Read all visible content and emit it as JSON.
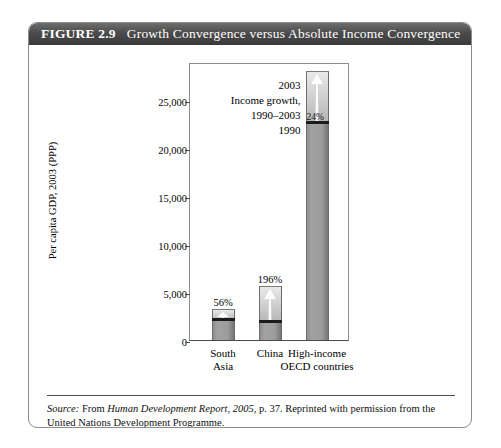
{
  "figure": {
    "number": "FIGURE 2.9",
    "title": "Growth Convergence versus Absolute Income Convergence"
  },
  "annotation": {
    "top": "2003",
    "middle_line1": "Income growth,",
    "middle_line2": "1990–2003",
    "bottom": "1990"
  },
  "source": {
    "label": "Source:",
    "text_before": " From ",
    "italic": "Human Development Report, 2005",
    "text_after": ", p. 37. Reprinted with permission from the United Nations Development Programme."
  },
  "colors": {
    "title_bar": "#4a4a4a",
    "bar_base": "#9c9c9c",
    "bar_growth": "#d2d2d2",
    "divider": "#1b1b1b",
    "frame": "#8e8e8e"
  },
  "chart_data": {
    "type": "bar",
    "title": "Growth Convergence versus Absolute Income Convergence",
    "xlabel": "",
    "ylabel": "Per capita GDP, 2003 (PPP)",
    "ylim": [
      0,
      29000
    ],
    "grid": false,
    "legend": false,
    "categories": [
      "South Asia",
      "China",
      "High-income OECD countries"
    ],
    "category_lines": [
      [
        "South",
        "Asia"
      ],
      [
        "China"
      ],
      [
        "High-income",
        "OECD countries"
      ]
    ],
    "yticks": [
      0,
      5000,
      10000,
      15000,
      20000,
      25000
    ],
    "ytick_labels": [
      "0",
      "5,000",
      "10,000",
      "15,000",
      "20,000",
      "25,000"
    ],
    "series": [
      {
        "name": "1990 income",
        "values": [
          2100,
          1900,
          22600
        ]
      },
      {
        "name": "Income growth, 1990–2003",
        "values": [
          1176,
          3724,
          5424
        ]
      }
    ],
    "totals_2003": [
      3276,
      5624,
      28024
    ],
    "growth_labels": [
      "56%",
      "196%",
      "24%"
    ],
    "growth_label_positions": [
      "above-bar",
      "above-bar",
      "on-bar"
    ]
  }
}
